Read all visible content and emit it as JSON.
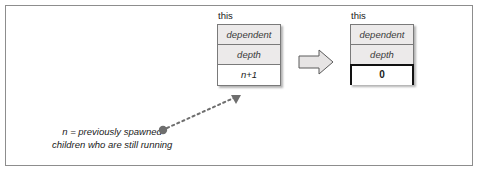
{
  "figure": {
    "type": "diagram",
    "frame_color": "#8d8d8d",
    "background": "#ffffff"
  },
  "left_struct": {
    "label": "this",
    "fields": [
      {
        "name": "dependent",
        "style": "shaded-italic"
      },
      {
        "name": "depth",
        "style": "shaded-italic"
      },
      {
        "name": "n+1",
        "style": "value-italic"
      }
    ]
  },
  "right_struct": {
    "label": "this",
    "fields": [
      {
        "name": "dependent",
        "style": "shaded-italic"
      },
      {
        "name": "depth",
        "style": "shaded-italic"
      },
      {
        "name": "0",
        "style": "value-bold-outlined"
      }
    ]
  },
  "block_arrow": {
    "direction": "right",
    "fill": "#e6e4e4",
    "stroke": "#5a5a5a"
  },
  "dashed_pointer": {
    "style": "dotted",
    "color": "#6e6e6e",
    "origin_marker": "bullet-dot",
    "head": "arrowhead-up-right"
  },
  "caption": {
    "line1": "n = previously spawned",
    "line2": "children who are still running"
  }
}
